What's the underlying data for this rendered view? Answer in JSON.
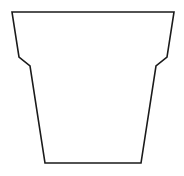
{
  "figure": {
    "stroke_color": "#1a1a1a",
    "fill_color": "#ffffff",
    "background": "#ffffff",
    "points": "12,12 174,12 167,57 156,66 141,163 45,163 30,66 19,57"
  }
}
